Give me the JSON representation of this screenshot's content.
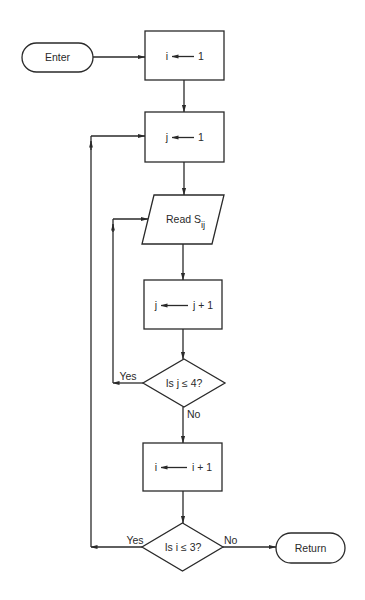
{
  "diagram": {
    "type": "flowchart",
    "nodes": {
      "enter": {
        "kind": "terminal",
        "text": "Enter"
      },
      "init_i": {
        "kind": "process",
        "lhs": "i",
        "rhs": "1"
      },
      "init_j": {
        "kind": "process",
        "lhs": "j",
        "rhs": "1"
      },
      "read": {
        "kind": "input-output",
        "text": "Read S",
        "subscript": "ij"
      },
      "inc_j": {
        "kind": "process",
        "lhs": "j",
        "rhs": "j + 1"
      },
      "test_j": {
        "kind": "decision",
        "text": "Is j ≤ 4?"
      },
      "inc_i": {
        "kind": "process",
        "lhs": "i",
        "rhs": "i + 1"
      },
      "test_i": {
        "kind": "decision",
        "text": "Is i ≤ 3?"
      },
      "return": {
        "kind": "terminal",
        "text": "Return"
      }
    },
    "edge_labels": {
      "test_j_yes": "Yes",
      "test_j_no": "No",
      "test_i_yes": "Yes",
      "test_i_no": "No"
    },
    "edges": [
      [
        "enter",
        "init_i"
      ],
      [
        "init_i",
        "init_j"
      ],
      [
        "init_j",
        "read"
      ],
      [
        "read",
        "inc_j"
      ],
      [
        "inc_j",
        "test_j"
      ],
      [
        "test_j",
        "read",
        "Yes"
      ],
      [
        "test_j",
        "inc_i",
        "No"
      ],
      [
        "inc_i",
        "test_i"
      ],
      [
        "test_i",
        "init_j",
        "Yes"
      ],
      [
        "test_i",
        "return",
        "No"
      ]
    ],
    "colors": {
      "ink": "#2a2a2a",
      "background": "#ffffff"
    }
  }
}
